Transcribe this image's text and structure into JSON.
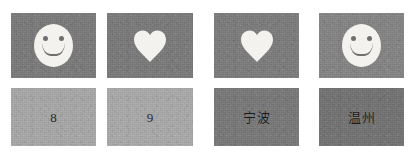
{
  "figure": {
    "name": "image-tile-grid",
    "background_color": "#ffffff",
    "rows": 2,
    "columns": 4
  },
  "colors": {
    "symbol_tile_background": "#7a7a7a",
    "numeral_tile_background": "#a8a8a8",
    "hanzi_tile_background": "#787878",
    "symbol_fill": "#f3f2ee",
    "symbol_feature": "#6f6f6f",
    "text_color": "#1d1d1d"
  },
  "tiles": [
    {
      "id": "tile-top-1",
      "row": "top",
      "column": 1,
      "kind": "symbol",
      "icon": "smiley-face-icon",
      "content": "",
      "background": "#7a7a7a",
      "x": 11,
      "y": 13,
      "w": 85,
      "h": 65
    },
    {
      "id": "tile-top-2",
      "row": "top",
      "column": 2,
      "kind": "symbol",
      "icon": "heart-icon",
      "content": "",
      "background": "#7a7a7a",
      "x": 107,
      "y": 13,
      "w": 86,
      "h": 65
    },
    {
      "id": "tile-top-3",
      "row": "top",
      "column": 3,
      "kind": "symbol",
      "icon": "heart-icon",
      "content": "",
      "background": "#7c7c7c",
      "x": 214,
      "y": 13,
      "w": 85,
      "h": 65
    },
    {
      "id": "tile-top-4",
      "row": "top",
      "column": 4,
      "kind": "symbol",
      "icon": "smiley-face-icon",
      "content": "",
      "background": "#848484",
      "x": 319,
      "y": 13,
      "w": 85,
      "h": 65
    },
    {
      "id": "tile-bottom-1",
      "row": "bottom",
      "column": 1,
      "kind": "numeral",
      "icon": "",
      "content": "8",
      "background": "#a8a8a8",
      "x": 11,
      "y": 88,
      "w": 85,
      "h": 58
    },
    {
      "id": "tile-bottom-2",
      "row": "bottom",
      "column": 2,
      "kind": "numeral",
      "icon": "",
      "content": "9",
      "background": "#aaaaaa",
      "x": 107,
      "y": 88,
      "w": 86,
      "h": 58
    },
    {
      "id": "tile-bottom-3",
      "row": "bottom",
      "column": 3,
      "kind": "hanzi",
      "icon": "",
      "content": "宁波",
      "background": "#787878",
      "x": 214,
      "y": 88,
      "w": 85,
      "h": 58
    },
    {
      "id": "tile-bottom-4",
      "row": "bottom",
      "column": 4,
      "kind": "hanzi",
      "icon": "",
      "content": "温州",
      "background": "#727272",
      "x": 319,
      "y": 88,
      "w": 85,
      "h": 58
    }
  ]
}
